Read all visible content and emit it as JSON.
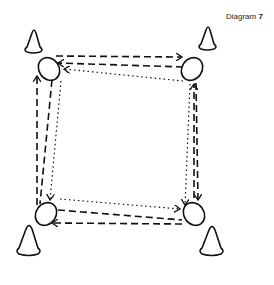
{
  "caption": {
    "label": "Diagram",
    "number": "7"
  },
  "colors": {
    "ink": "#111111",
    "background": "#ffffff"
  },
  "diagram": {
    "cones": [
      {
        "name": "cone-top-left",
        "x": 33,
        "y": 30
      },
      {
        "name": "cone-top-right",
        "x": 209,
        "y": 28
      },
      {
        "name": "cone-bottom-left",
        "x": 29,
        "y": 252
      },
      {
        "name": "cone-bottom-right",
        "x": 211,
        "y": 253
      }
    ],
    "players": [
      {
        "name": "player-top-left",
        "x": 49,
        "y": 68
      },
      {
        "name": "player-top-right",
        "x": 192,
        "y": 69
      },
      {
        "name": "player-bottom-left",
        "x": 45,
        "y": 214
      },
      {
        "name": "player-bottom-right",
        "x": 194,
        "y": 214
      }
    ],
    "line_styles": [
      "long-dash run",
      "short-dash pass",
      "dotted path"
    ]
  }
}
